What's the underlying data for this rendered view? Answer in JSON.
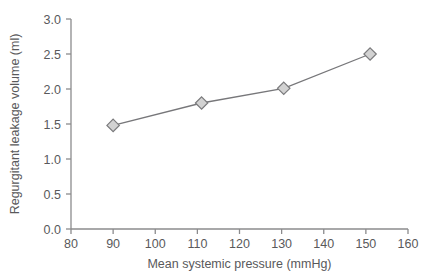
{
  "chart_data": {
    "type": "line",
    "title": "",
    "xlabel": "Mean systemic pressure (mmHg)",
    "ylabel": "Regurgitant leakage volume (ml)",
    "xlim": [
      80,
      160
    ],
    "ylim": [
      0.0,
      3.0
    ],
    "xticks": [
      80,
      90,
      100,
      110,
      120,
      130,
      140,
      150,
      160
    ],
    "xtick_labels": [
      "80",
      "90",
      "100",
      "110",
      "120",
      "130",
      "140",
      "150",
      "160"
    ],
    "yticks": [
      0.0,
      0.5,
      1.0,
      1.5,
      2.0,
      2.5,
      3.0
    ],
    "ytick_labels": [
      "0.0",
      "0.5",
      "1.0",
      "1.5",
      "2.0",
      "2.5",
      "3.0"
    ],
    "grid": false,
    "legend": null,
    "marker": "diamond",
    "marker_face_color": "#d2d2d2",
    "marker_edge_color": "#7a7a7c",
    "line_color": "#77777a",
    "axis_color": "#8b8b8d",
    "text_color": "#59595b",
    "background": "#ffffff",
    "series": [
      {
        "name": "Regurgitant leakage volume",
        "x": [
          90,
          111,
          130.5,
          151
        ],
        "values": [
          1.48,
          1.8,
          2.01,
          2.5
        ]
      }
    ]
  }
}
